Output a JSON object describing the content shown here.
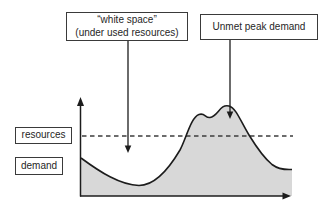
{
  "figure": {
    "callouts": {
      "white_space": {
        "line1": "“white space”",
        "line2": "(under used resources)"
      },
      "unmet_peak_demand": {
        "label": "Unmet peak demand"
      }
    },
    "level_labels": {
      "resources": "resources",
      "demand": "demand"
    },
    "colors": {
      "area_fill": "#d8d8d8",
      "line": "#1c1c1c",
      "dashed_line": "#3c3c3c",
      "box_border": "#3a3a3a",
      "background": "#ffffff"
    },
    "paths": {
      "demand_area": "M81,158 C100,172 120,185 139,185.5 C153,185.5 167,172 180,150 C186,139 191,117 199,114.5 C205,112.5 205,118 210,117.5 C218,116.5 220,103.5 229,106 C236,108 240,120 249,135 C257,148 264,158 272,164.5 C280,170.5 287,169.5 292,169.5 L292,196 L81,196 Z",
      "demand_curve": "M81,158 C100,172 120,185 139,185.5 C153,185.5 167,172 180,150 C186,139 191,117 199,114.5 C205,112.5 205,118 210,117.5 C218,116.5 220,103.5 229,106 C236,108 240,120 249,135 C257,148 264,158 272,164.5 C280,170.5 287,169.5 292,169.5"
    }
  }
}
